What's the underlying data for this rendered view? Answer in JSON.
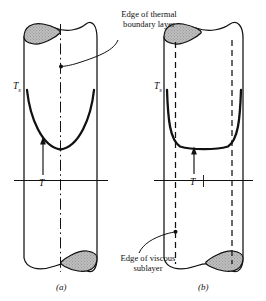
{
  "figure": {
    "kind": "technical-illustration",
    "annotations": {
      "thermal_layer_line1": "Edge of thermal",
      "thermal_layer_line2": "boundary layer",
      "viscous_layer_line1": "Edge of viscous",
      "viscous_layer_line2": "sublayer"
    },
    "symbols": {
      "surface_temperature": "T",
      "surface_temperature_sub": "s",
      "temperature": "T"
    },
    "panels": [
      {
        "caption": "(a)",
        "regime": "laminar",
        "profile": "parabolic"
      },
      {
        "caption": "(b)",
        "regime": "turbulent",
        "profile": "flat-core"
      }
    ],
    "colors": {
      "ink": "#111111",
      "ellipse_fill": "#b9b9b9",
      "paper": "#ffffff"
    }
  }
}
